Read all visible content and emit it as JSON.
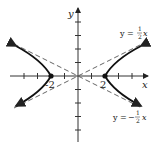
{
  "figure": {
    "type": "hyperbola",
    "equation": "x^2/4 - y^2 = 1",
    "axes": {
      "x_label": "x",
      "y_label": "y"
    },
    "vertices": [
      {
        "x": -2,
        "y": 0,
        "label": "-2"
      },
      {
        "x": 2,
        "y": 0,
        "label": "2"
      }
    ],
    "asymptotes": [
      {
        "label_lhs": "y =",
        "num": "1",
        "den": "2",
        "var": "x",
        "sign": ""
      },
      {
        "label_lhs": "y =",
        "num": "1",
        "den": "2",
        "var": "x",
        "sign": "−"
      }
    ],
    "colors": {
      "curve": "#111111",
      "asymptote": "#555555",
      "axis": "#333333"
    }
  }
}
